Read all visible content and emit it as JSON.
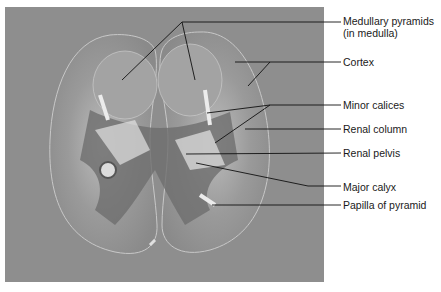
{
  "figure": {
    "colors": {
      "background": "#ffffff",
      "photo_background": "#8e8e8e",
      "kidney_tissue": "#9c9c9c",
      "cortex_outline": "#c8c8c8",
      "leader_line": "#111111",
      "label_text": "#1a1a1a"
    },
    "labels": [
      {
        "id": "medullary-pyramids",
        "line1": "Medullary pyramids",
        "line2": "(in medulla)"
      },
      {
        "id": "cortex",
        "line1": "Cortex"
      },
      {
        "id": "minor-calices",
        "line1": "Minor calices"
      },
      {
        "id": "renal-column",
        "line1": "Renal column"
      },
      {
        "id": "renal-pelvis",
        "line1": "Renal pelvis"
      },
      {
        "id": "major-calyx",
        "line1": "Major calyx"
      },
      {
        "id": "papilla-of-pyramid",
        "line1": "Papilla of pyramid"
      }
    ]
  }
}
